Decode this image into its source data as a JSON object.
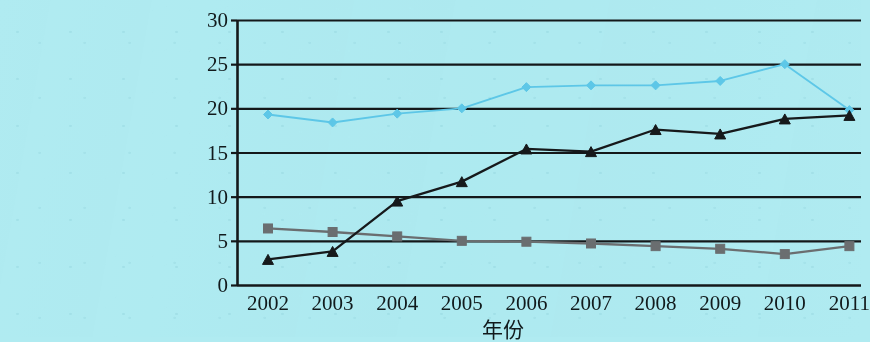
{
  "chart_data": {
    "type": "line",
    "title": "",
    "xlabel": "年份",
    "ylabel": "",
    "categories": [
      "2002",
      "2003",
      "2004",
      "2005",
      "2006",
      "2007",
      "2008",
      "2009",
      "2010",
      "2011"
    ],
    "x": [
      2002,
      2003,
      2004,
      2005,
      2006,
      2007,
      2008,
      2009,
      2010,
      2011
    ],
    "ylim": [
      0,
      30
    ],
    "yticks": [
      0,
      5,
      10,
      15,
      20,
      25,
      30
    ],
    "ytick_labels": [
      "0",
      "5",
      "10",
      "15",
      "20",
      "25",
      "30"
    ],
    "grid": "horizontal",
    "legend": "none",
    "series": [
      {
        "name": "series-light-blue",
        "color": "#5ec8e8",
        "marker": "diamond",
        "values": [
          19.3,
          18.4,
          19.4,
          20.0,
          22.4,
          22.6,
          22.6,
          23.1,
          25.0,
          19.8
        ]
      },
      {
        "name": "series-black-triangle",
        "color": "#16191b",
        "marker": "triangle",
        "values": [
          2.9,
          3.8,
          9.5,
          11.7,
          15.4,
          15.1,
          17.6,
          17.1,
          18.8,
          19.2
        ]
      },
      {
        "name": "series-gray-square",
        "color": "#6b6e70",
        "marker": "square",
        "values": [
          6.4,
          6.0,
          5.5,
          5.0,
          4.9,
          4.7,
          4.4,
          4.1,
          3.5,
          4.4
        ]
      }
    ]
  },
  "axes": {
    "y_labels": [
      "30",
      "25",
      "20",
      "15",
      "10",
      "5",
      "0"
    ],
    "x_labels": [
      "2002",
      "2003",
      "2004",
      "2005",
      "2006",
      "2007",
      "2008",
      "2009",
      "2010",
      "2011"
    ],
    "x_axis_title": "年份"
  },
  "colors": {
    "background": "#b0ebf1",
    "axis": "#14181a",
    "gridline": "#14181a",
    "series_light_blue": "#5ec8e8",
    "series_black": "#16191b",
    "series_gray": "#6b6e70",
    "tick_text": "#111a1c"
  }
}
